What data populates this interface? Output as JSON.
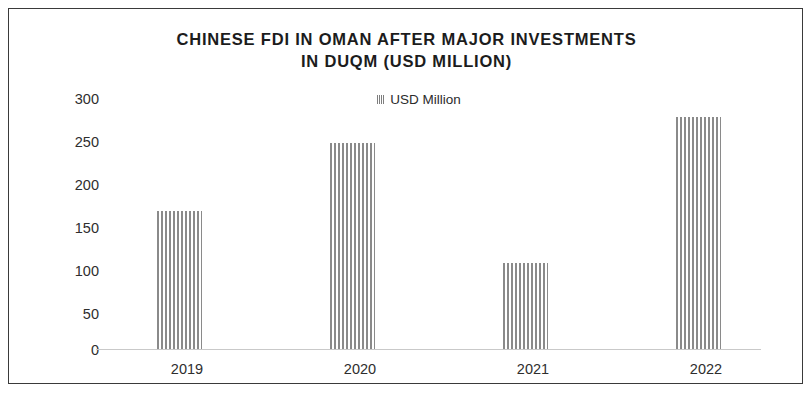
{
  "chart_data": {
    "type": "bar",
    "title": "CHINESE FDI IN OMAN AFTER MAJOR INVESTMENTS IN DUQM (USD MILLION)",
    "title_line1": "CHINESE FDI IN OMAN AFTER MAJOR INVESTMENTS",
    "title_line2": "IN DUQM (USD MILLION)",
    "subtitle": "",
    "xlabel": "",
    "ylabel": "",
    "categories": [
      "2019",
      "2020",
      "2021",
      "2022"
    ],
    "values": [
      160,
      240,
      100,
      270
    ],
    "series": [
      {
        "name": "USD Million",
        "values": [
          160,
          240,
          100,
          270
        ]
      }
    ],
    "yticks": [
      "300",
      "250",
      "200",
      "150",
      "100",
      "50",
      "0"
    ],
    "ytick_values": [
      300,
      250,
      200,
      150,
      100,
      50,
      0
    ],
    "ylim": [
      0,
      300
    ],
    "grid": false,
    "legend": {
      "position": "top-center",
      "entries": [
        "USD Million"
      ]
    },
    "bar_fill": "#8a8a8a",
    "bar_pattern": "vertical-stripes",
    "border_color": "#3a3a3a",
    "axis_color": "#c9c9c9",
    "text_color": "#2e2e2e"
  },
  "legend": {
    "label": "USD Million"
  }
}
